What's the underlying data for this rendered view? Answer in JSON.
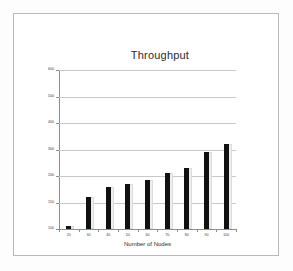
{
  "chart_data": {
    "type": "bar",
    "title": "Throughput",
    "xlabel": "Number of Nodes",
    "ylabel": "",
    "categories": [
      "20",
      "30",
      "40",
      "50",
      "60",
      "70",
      "80",
      "90",
      "100"
    ],
    "values": [
      105,
      160,
      180,
      185,
      192,
      210,
      232,
      290,
      320
    ],
    "ytick_labels": [
      "600",
      "500",
      "400",
      "300",
      "200",
      "150",
      "100"
    ],
    "xtick_labels": [
      "20",
      "30",
      "40",
      "50",
      "60",
      "70",
      "80",
      "90",
      "100"
    ],
    "ylim": [
      100,
      600
    ],
    "grid": true,
    "legend": "none",
    "series": [
      {
        "name": "Throughput",
        "values": [
          105,
          160,
          180,
          185,
          192,
          210,
          232,
          290,
          320
        ]
      }
    ],
    "colors": {
      "bar": "#111111",
      "bar_shadow": "#eeeeee",
      "gridline": "#c8c8c8",
      "axis": "#8d8d8d",
      "frame": "#b9b9b9",
      "background": "#ffffff",
      "text": "#2b2b2b"
    }
  }
}
